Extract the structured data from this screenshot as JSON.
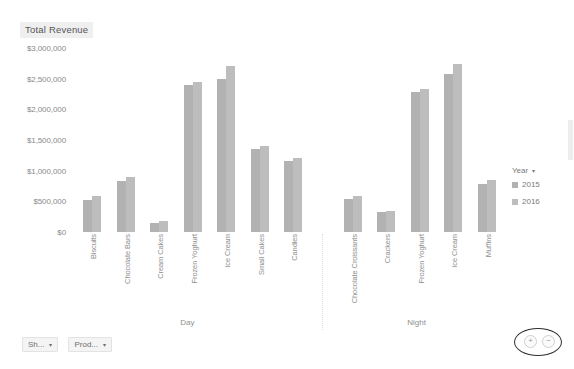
{
  "chart_title": "Total Revenue",
  "axis": {
    "y_ticks": [
      "$0",
      "$500,000",
      "$1,000,000",
      "$1,500,000",
      "$2,000,000",
      "$2,500,000",
      "$3,000,000"
    ]
  },
  "panels": [
    {
      "label": "Day"
    },
    {
      "label": "Night"
    }
  ],
  "legend": {
    "title": "Year",
    "caret": "▾",
    "entries": [
      {
        "label": "2015",
        "color": "#b2b2b2"
      },
      {
        "label": "2016",
        "color": "#bdbdbd"
      }
    ]
  },
  "filters": [
    {
      "label": "Sh...",
      "caret": "▾"
    },
    {
      "label": "Prod...",
      "caret": "▾"
    }
  ],
  "zoom_control": {
    "zoom_in": "+",
    "zoom_out": "−"
  },
  "chart_data": {
    "type": "bar",
    "title": "Total Revenue",
    "xlabel": "",
    "ylabel": "Total Revenue",
    "ylim": [
      0,
      3000000
    ],
    "ytick_values": [
      0,
      500000,
      1000000,
      1500000,
      2000000,
      2500000,
      3000000
    ],
    "grid": false,
    "legend_position": "right",
    "panel_field": "Shift",
    "panels": [
      "Day",
      "Night"
    ],
    "categories": [
      {
        "panel": "Day",
        "name": "Biscuits"
      },
      {
        "panel": "Day",
        "name": "Chocolate Bars"
      },
      {
        "panel": "Day",
        "name": "Cream Cakes"
      },
      {
        "panel": "Day",
        "name": "Frozen Yoghurt"
      },
      {
        "panel": "Day",
        "name": "Ice Cream"
      },
      {
        "panel": "Day",
        "name": "Small Cakes"
      },
      {
        "panel": "Day",
        "name": "Candies"
      },
      {
        "panel": "Night",
        "name": "Chocolate Croissants"
      },
      {
        "panel": "Night",
        "name": "Crackers"
      },
      {
        "panel": "Night",
        "name": "Frozen Yoghurt"
      },
      {
        "panel": "Night",
        "name": "Ice Cream"
      },
      {
        "panel": "Night",
        "name": "Muffins"
      }
    ],
    "series": [
      {
        "name": "2015",
        "color": "#b2b2b2",
        "values": [
          530000,
          830000,
          150000,
          2400000,
          2500000,
          1350000,
          1150000,
          540000,
          330000,
          2280000,
          2580000,
          790000
        ]
      },
      {
        "name": "2016",
        "color": "#bdbdbd",
        "values": [
          590000,
          890000,
          185000,
          2440000,
          2700000,
          1400000,
          1210000,
          590000,
          345000,
          2330000,
          2740000,
          840000
        ]
      }
    ]
  }
}
